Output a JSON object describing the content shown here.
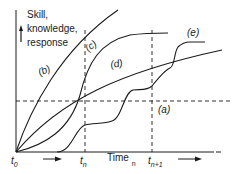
{
  "figure": {
    "y_axis_label_lines": [
      "Skill,",
      "knowledge,",
      "response"
    ],
    "x_axis_label": "Time",
    "x_axis_label_subscript": "n",
    "ticks": [
      {
        "id": "t0",
        "main": "t",
        "sub": "0"
      },
      {
        "id": "tn",
        "main": "t",
        "sub": "n"
      },
      {
        "id": "tn1",
        "main": "t",
        "sub": "n+1"
      }
    ],
    "curve_labels": {
      "a": "(a)",
      "b": "(b)",
      "c": "(c)",
      "d": "(d)",
      "e": "(e)"
    },
    "colors": {
      "ink": "#1a1a1a",
      "background": "#ffffff"
    }
  }
}
